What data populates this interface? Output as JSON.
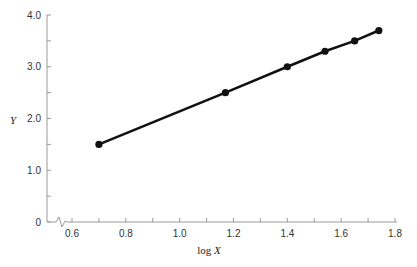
{
  "chart_data": {
    "type": "line",
    "title": "",
    "xlabel": "log X",
    "ylabel": "Y",
    "xlim": [
      0.6,
      1.8
    ],
    "ylim": [
      0,
      4.0
    ],
    "grid": false,
    "legend": null,
    "x_axis_break": true,
    "x_ticks": [
      0.6,
      0.8,
      1.0,
      1.2,
      1.4,
      1.6,
      1.8
    ],
    "x_tick_labels": [
      "0.6",
      "0.8",
      "1.0",
      "1.2",
      "1.4",
      "1.6",
      "1.8"
    ],
    "y_ticks": [
      0,
      1.0,
      2.0,
      3.0,
      4.0
    ],
    "y_tick_labels": [
      "0",
      "1.0",
      "2.0",
      "3.0",
      "4.0"
    ],
    "series": [
      {
        "name": "Y vs log X",
        "x": [
          0.7,
          1.17,
          1.4,
          1.54,
          1.65,
          1.74
        ],
        "values": [
          1.5,
          2.5,
          3.0,
          3.3,
          3.5,
          3.7
        ],
        "color": "#111111",
        "marker": "circle"
      }
    ]
  },
  "labels": {
    "xlabel_prefix": "log ",
    "xlabel_var": "X",
    "ylabel": "Y"
  }
}
